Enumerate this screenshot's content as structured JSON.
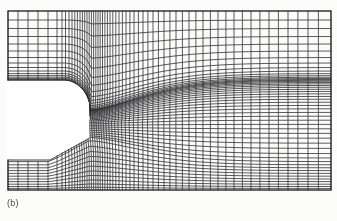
{
  "figure": {
    "caption": "(b)",
    "type": "computational-mesh",
    "background_color": "#fbfbf9",
    "line_color": "#26262a",
    "void_color": "#fefefe"
  },
  "chart_data": {
    "type": "mesh",
    "title": "",
    "subtitle": "",
    "xlabel": "",
    "ylabel": "",
    "grid": true,
    "legend": null,
    "annotations": [
      "(b)"
    ],
    "domain": {
      "x_min": 8,
      "x_max": 331,
      "y_min": 11,
      "y_max": 190
    },
    "body_void": {
      "left": 8,
      "top": 80,
      "bottom": 160,
      "nose_x": 90,
      "upper_corner_radius": 26,
      "lower_corner_bevel": 40,
      "comment": "blank solid region occupying the left-centre of the domain"
    },
    "i_lines": {
      "count": 54,
      "clustering": "strong compression between x=60 and x=110 near the body shoulder, gentle stretching toward the right outflow boundary",
      "positions": [
        8,
        18,
        28,
        38,
        48,
        57,
        62,
        65.5,
        69,
        72,
        74.8,
        77.4,
        80,
        82.4,
        84.7,
        87,
        89.2,
        91.4,
        93.6,
        95.8,
        98,
        100.2,
        102.5,
        104.9,
        107.4,
        110,
        112.8,
        115.8,
        119,
        122.4,
        126,
        129.9,
        134,
        138.4,
        143,
        147.9,
        153,
        158.4,
        164,
        169.9,
        176,
        182.4,
        189,
        195.9,
        203,
        210.4,
        218,
        225.9,
        234,
        242.4,
        251,
        259.9,
        269,
        278.4,
        288,
        297.9,
        308,
        318.4,
        331
      ]
    },
    "j_lines": {
      "count": 48,
      "clustering": "sparse near the upper far-field boundary, strongly compressed in the shear-layer band just below y=80 and again near the lower wall",
      "positions": [
        11,
        20,
        28.5,
        36.5,
        44,
        51,
        57.5,
        63,
        67.5,
        71,
        73.6,
        75.6,
        77.2,
        78.4,
        79.4,
        80.2,
        81.2,
        82.4,
        83.8,
        85.4,
        87.2,
        89.2,
        91.4,
        93.8,
        96.4,
        99.2,
        102.2,
        105.4,
        108.8,
        112.4,
        116.2,
        120.2,
        124.4,
        128.8,
        133.4,
        138.2,
        143.2,
        148.4,
        153.6,
        158,
        161.6,
        164.8,
        167.8,
        170.6,
        173.4,
        176.2,
        179,
        181.6,
        184.2,
        186.5,
        188.4,
        190
      ]
    },
    "regions": [
      {
        "name": "upper-inlet-block",
        "x_range": [
          8,
          62
        ],
        "y_range": [
          11,
          80
        ]
      },
      {
        "name": "lower-inlet-block",
        "x_range": [
          8,
          90
        ],
        "y_range": [
          160,
          190
        ]
      },
      {
        "name": "wake-block",
        "x_range": [
          62,
          331
        ],
        "y_range": [
          11,
          190
        ]
      }
    ]
  }
}
